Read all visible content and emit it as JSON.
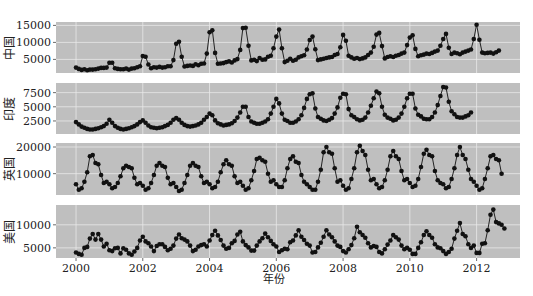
{
  "chart_data": {
    "type": "line",
    "title": "",
    "xlabel": "年份",
    "x_start": 2000.0,
    "x_step_months": 1,
    "x_ticks": [
      2000,
      2002,
      2004,
      2006,
      2008,
      2010,
      2012
    ],
    "xlim": [
      1999.4,
      2013.3
    ],
    "grid": true,
    "legend": null,
    "panels": [
      {
        "name": "中国",
        "ylabel": "中国",
        "yticks": [
          5000,
          10000,
          15000
        ],
        "ylim": [
          1000,
          16000
        ],
        "values": [
          2600,
          2200,
          1900,
          2100,
          1800,
          2000,
          2000,
          2100,
          2300,
          2500,
          2500,
          2600,
          4000,
          4000,
          2400,
          2200,
          2100,
          2100,
          2300,
          2000,
          2300,
          2400,
          2700,
          3000,
          6000,
          5800,
          3500,
          2400,
          2700,
          2600,
          2800,
          2600,
          2700,
          3000,
          3000,
          4800,
          9600,
          10200,
          5800,
          2900,
          3100,
          3200,
          3100,
          3600,
          3300,
          3700,
          3800,
          6700,
          13000,
          13600,
          6900,
          3700,
          3800,
          3900,
          4200,
          4400,
          4100,
          4700,
          5100,
          7800,
          14200,
          14300,
          9000,
          4700,
          4900,
          4500,
          5400,
          4900,
          5000,
          5800,
          6100,
          8300,
          11700,
          13800,
          8300,
          4200,
          4600,
          5200,
          4600,
          4900,
          5600,
          5900,
          6200,
          7900,
          10700,
          11700,
          8000,
          4800,
          5000,
          5200,
          5400,
          5600,
          5700,
          6300,
          6600,
          8600,
          12200,
          10500,
          6100,
          5600,
          5200,
          5400,
          5100,
          5300,
          5600,
          6300,
          7000,
          8700,
          12300,
          12800,
          8900,
          5300,
          5700,
          5900,
          5700,
          6100,
          6300,
          6700,
          7000,
          9200,
          11400,
          12100,
          8100,
          5900,
          6200,
          6400,
          6700,
          6600,
          6900,
          7300,
          7600,
          9000,
          11000,
          12500,
          8400,
          6600,
          7000,
          6800,
          6500,
          7000,
          7300,
          7600,
          7900,
          11000,
          15200,
          10800,
          7000,
          6800,
          6900,
          7000,
          6700,
          7100,
          7600
        ]
      },
      {
        "name": "印度",
        "ylabel": "印度",
        "yticks": [
          2500,
          5000,
          7500
        ],
        "ylim": [
          200,
          9200
        ],
        "values": [
          2300,
          1900,
          1500,
          1300,
          1100,
          1000,
          1000,
          1100,
          1200,
          1400,
          1600,
          2000,
          2700,
          2200,
          1600,
          1300,
          1100,
          1000,
          1100,
          1200,
          1400,
          1600,
          1900,
          2300,
          2600,
          2200,
          1700,
          1400,
          1300,
          1200,
          1300,
          1400,
          1600,
          1800,
          2200,
          2700,
          3000,
          2700,
          2200,
          1800,
          1600,
          1500,
          1600,
          1700,
          1900,
          2200,
          2700,
          3200,
          3800,
          3500,
          2600,
          2100,
          1900,
          1700,
          1800,
          1900,
          2100,
          2500,
          3100,
          4000,
          5000,
          5000,
          3200,
          2400,
          2200,
          2000,
          2000,
          2200,
          2400,
          2800,
          3800,
          5000,
          6400,
          5600,
          3800,
          2700,
          2500,
          2200,
          2200,
          2400,
          2800,
          3500,
          4800,
          6400,
          7200,
          7400,
          4700,
          3200,
          2900,
          2600,
          2500,
          2700,
          3000,
          3800,
          4900,
          6600,
          7300,
          7200,
          4600,
          3500,
          3200,
          2800,
          2600,
          2700,
          3100,
          4000,
          5200,
          6500,
          7700,
          7400,
          5000,
          3600,
          3100,
          2900,
          2600,
          2700,
          3100,
          3800,
          5000,
          6500,
          7300,
          7300,
          4700,
          3600,
          3300,
          2900,
          2800,
          2800,
          3200,
          4000,
          5300,
          6900,
          8500,
          8400,
          5900,
          4200,
          3700,
          3200,
          3100,
          3100,
          3300,
          3500,
          4000
        ]
      },
      {
        "name": "英国",
        "ylabel": "英国",
        "yticks": [
          10000,
          20000
        ],
        "ylim": [
          2000,
          21500
        ],
        "values": [
          6000,
          4000,
          4500,
          7000,
          10500,
          16500,
          17000,
          14000,
          13500,
          9500,
          6500,
          7000,
          6000,
          4500,
          5000,
          6500,
          9000,
          12000,
          13000,
          12500,
          12000,
          8500,
          6000,
          6500,
          5500,
          4000,
          4500,
          6500,
          9500,
          13000,
          14000,
          13000,
          12500,
          8500,
          6000,
          6500,
          5000,
          3500,
          4000,
          6500,
          9500,
          13000,
          14000,
          13000,
          12500,
          9000,
          6500,
          7000,
          6000,
          4500,
          5000,
          7000,
          10500,
          13500,
          15000,
          13500,
          13000,
          9000,
          6500,
          7000,
          5500,
          4000,
          4500,
          7500,
          11000,
          15500,
          16000,
          15000,
          14500,
          10000,
          7000,
          7500,
          6000,
          5000,
          5000,
          7500,
          12000,
          15500,
          16500,
          14500,
          14000,
          9500,
          7000,
          6000,
          5000,
          4000,
          4000,
          7000,
          11500,
          18000,
          20000,
          18000,
          17500,
          12000,
          7000,
          7500,
          5500,
          4000,
          4500,
          8000,
          12000,
          18000,
          20500,
          18500,
          17000,
          11500,
          7500,
          8000,
          6000,
          4500,
          5000,
          7500,
          11500,
          16500,
          18500,
          16500,
          15500,
          11000,
          7500,
          8000,
          6500,
          5000,
          5500,
          8000,
          12500,
          17500,
          19000,
          17000,
          16500,
          11000,
          7500,
          6500,
          6000,
          4500,
          5000,
          8000,
          12000,
          17000,
          20000,
          17000,
          15500,
          11500,
          8000,
          7000,
          5500,
          4000,
          4500,
          8000,
          12000,
          16500,
          17000,
          15500,
          15000,
          10000
        ]
      },
      {
        "name": "美国",
        "ylabel": "美国",
        "yticks": [
          5000,
          10000
        ],
        "ylim": [
          2800,
          14300
        ],
        "values": [
          4000,
          3700,
          3500,
          5000,
          5200,
          7000,
          8000,
          6800,
          8000,
          6800,
          5300,
          5900,
          4500,
          4300,
          4900,
          5000,
          3800,
          4900,
          4600,
          3800,
          3500,
          4200,
          5000,
          6600,
          7400,
          6400,
          6000,
          5300,
          4300,
          5400,
          5800,
          5800,
          5200,
          4500,
          4800,
          5500,
          7000,
          7900,
          7100,
          6800,
          6400,
          5500,
          4300,
          4600,
          5300,
          5600,
          5800,
          5300,
          6600,
          7800,
          8700,
          7700,
          6700,
          5500,
          4800,
          5000,
          6000,
          6500,
          7900,
          8500,
          6400,
          5600,
          5100,
          4400,
          4400,
          5500,
          6400,
          7100,
          8100,
          7300,
          6500,
          5800,
          5300,
          4100,
          4500,
          4800,
          4700,
          6200,
          6600,
          7700,
          8800,
          7400,
          6700,
          5900,
          5500,
          4000,
          4100,
          5100,
          6100,
          7400,
          8800,
          7900,
          7300,
          6400,
          5500,
          5200,
          4300,
          4000,
          4700,
          5600,
          7100,
          9600,
          8400,
          7800,
          7200,
          6000,
          5100,
          5400,
          5200,
          4100,
          3800,
          4700,
          5700,
          6600,
          7800,
          7300,
          6800,
          5500,
          4700,
          5000,
          4600,
          3700,
          3700,
          5000,
          6200,
          7800,
          8600,
          7800,
          7200,
          5800,
          5100,
          4900,
          4300,
          3700,
          4100,
          4800,
          7000,
          8700,
          10400,
          8000,
          7500,
          5800,
          5000,
          5500,
          3900,
          3900,
          5900,
          6000,
          8800,
          12200,
          13300,
          10600,
          10300,
          10000,
          9200
        ]
      }
    ]
  },
  "panels_labels": [
    "中国",
    "印度",
    "英国",
    "美国"
  ],
  "xaxis": {
    "label": "年份",
    "ticks": [
      "2000",
      "2002",
      "2004",
      "2006",
      "2008",
      "2010",
      "2012"
    ]
  }
}
